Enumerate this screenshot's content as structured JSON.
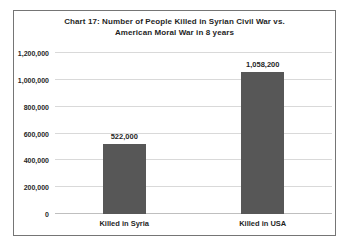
{
  "page": {
    "background": "#ffffff",
    "border_color": "#757575"
  },
  "chart_data": {
    "type": "bar",
    "title": "Chart 17: Number of People Killed  in Syrian Civil War vs. American Moral War in 8 years",
    "title_lines": [
      "Chart 17: Number of People Killed  in Syrian Civil War vs.",
      "American Moral War in 8 years"
    ],
    "categories": [
      "Killed in Syria",
      "Killed in USA"
    ],
    "values": [
      522000,
      1058200
    ],
    "value_labels": [
      "522,000",
      "1,058,200"
    ],
    "xlabel": "",
    "ylabel": "",
    "ylim": [
      0,
      1200000
    ],
    "yticks": [
      0,
      200000,
      400000,
      600000,
      800000,
      1000000,
      1200000
    ],
    "ytick_labels": [
      "0",
      "200,000",
      "400,000",
      "600,000",
      "800,000",
      "1,000,000",
      "1,200,000"
    ],
    "grid": true,
    "legend": false,
    "bar_color": "#575757",
    "gridline_color": "#d9d9d9",
    "axis_line_color": "#bfbfbf",
    "text_color": "#1f1f1f"
  }
}
